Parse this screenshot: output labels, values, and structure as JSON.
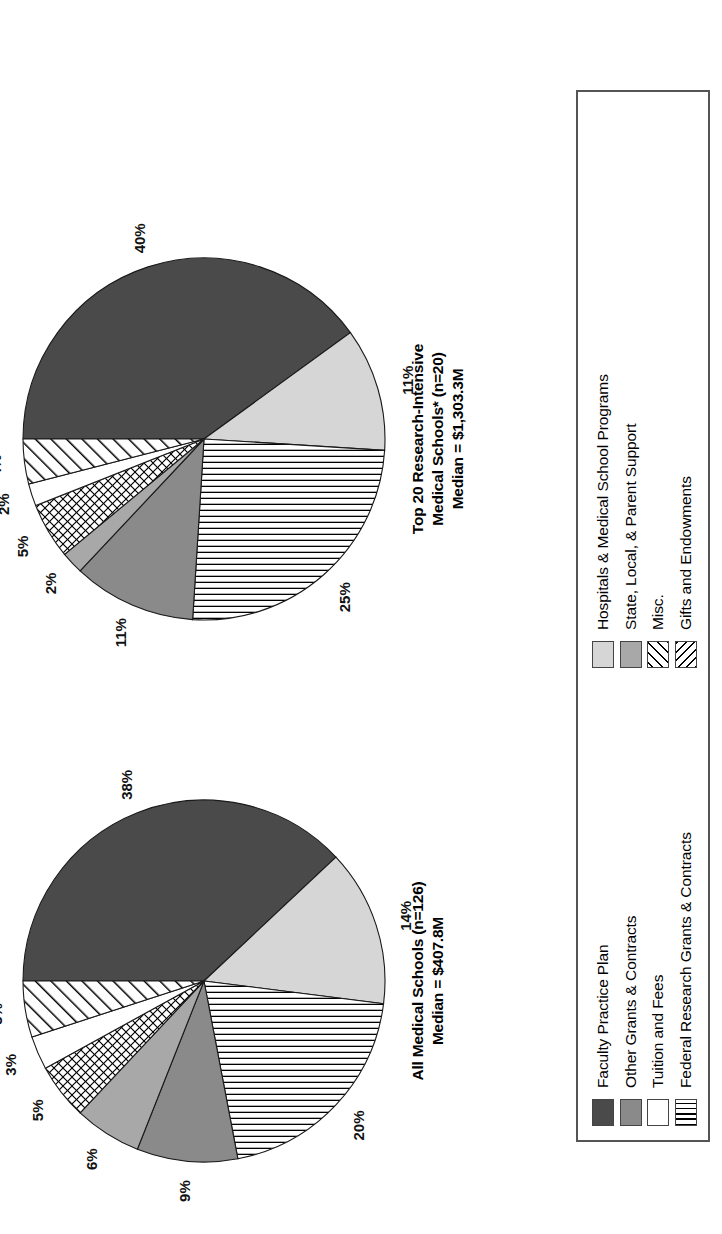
{
  "figure": {
    "orientation": "rotated-90-ccw",
    "background": "#ffffff"
  },
  "legend": {
    "name": "chart-legend",
    "items": [
      {
        "label": "Faculty Practice Plan",
        "key": "fpp",
        "fill": "#4a4a4a",
        "pattern": "solid"
      },
      {
        "label": "Hospitals & Medical School Programs",
        "key": "hosp",
        "fill": "#d6d6d6",
        "pattern": "solid"
      },
      {
        "label": "Other Grants & Contracts",
        "key": "other",
        "fill": "#8a8a8a",
        "pattern": "solid"
      },
      {
        "label": "State, Local, & Parent Support",
        "key": "state",
        "fill": "#a8a8a8",
        "pattern": "solid"
      },
      {
        "label": "Tuition and Fees",
        "key": "tuition",
        "fill": "#ffffff",
        "pattern": "solid"
      },
      {
        "label": "Misc.",
        "key": "misc",
        "fill": "#ffffff",
        "pattern": "diagonal-hatch"
      },
      {
        "label": "Federal Research Grants & Contracts",
        "key": "fed",
        "fill": "#ffffff",
        "pattern": "vertical-lines"
      },
      {
        "label": "Gifts and Endowments",
        "key": "gifts",
        "fill": "#ffffff",
        "pattern": "cross-hatch"
      }
    ]
  },
  "chart_data": [
    {
      "type": "pie",
      "name": "all-medical-schools",
      "title": "All Medical Schools (n=126)",
      "subtitle": "Median = $407.8M",
      "title_line1": "All Medical Schools (n=126)",
      "title_line2": "Median = $407.8M",
      "unit": "percent",
      "categories": [
        "Faculty Practice Plan",
        "Hospitals & Medical School Programs",
        "Federal Research Grants & Contracts",
        "Other Grants & Contracts",
        "State, Local, & Parent Support",
        "Gifts and Endowments",
        "Tuition and Fees",
        "Misc."
      ],
      "values": [
        38,
        14,
        20,
        9,
        6,
        5,
        3,
        5
      ],
      "labels": [
        "38%",
        "14%",
        "20%",
        "9%",
        "6%",
        "5%",
        "3%",
        "5%"
      ],
      "keys": [
        "fpp",
        "hosp",
        "fed",
        "other",
        "state",
        "gifts",
        "tuition",
        "misc"
      ],
      "legend_position": "below"
    },
    {
      "type": "pie",
      "name": "top-20-research-intensive",
      "title": "Top 20 Research-Intensive Medical Schools* (n=20)",
      "subtitle": "Median = $1,303.3M",
      "title_line1": "Top 20 Research-Intensive",
      "title_line2": "Medical Schools* (n=20)",
      "title_line3": "Median = $1,303.3M",
      "unit": "percent",
      "categories": [
        "Faculty Practice Plan",
        "Hospitals & Medical School Programs",
        "Federal Research Grants & Contracts",
        "Other Grants & Contracts",
        "State, Local, & Parent Support",
        "Gifts and Endowments",
        "Tuition and Fees",
        "Misc."
      ],
      "values": [
        40,
        11,
        25,
        11,
        2,
        5,
        2,
        4
      ],
      "labels": [
        "40%",
        "11%",
        "25%",
        "11%",
        "2%",
        "5%",
        "2%",
        "4%"
      ],
      "keys": [
        "fpp",
        "hosp",
        "fed",
        "other",
        "state",
        "gifts",
        "tuition",
        "misc"
      ],
      "legend_position": "below"
    }
  ]
}
